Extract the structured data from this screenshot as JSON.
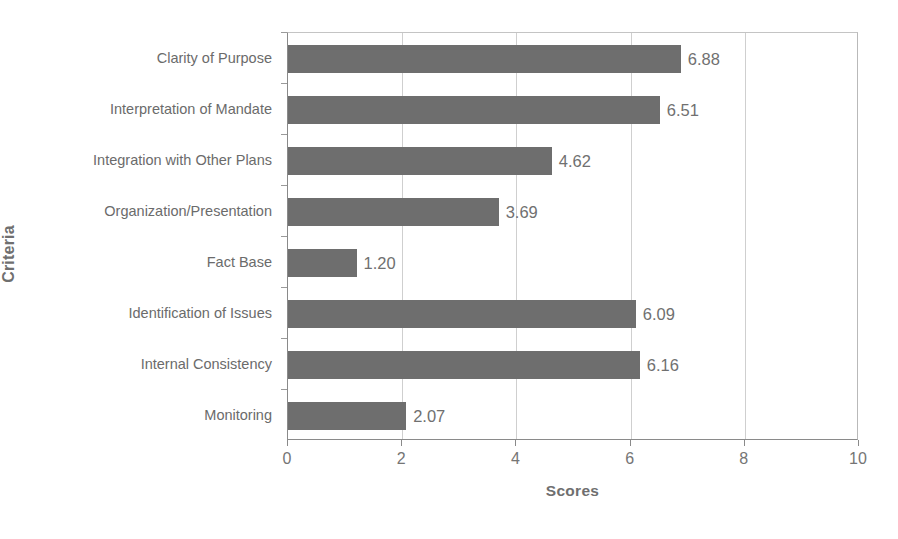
{
  "chart_data": {
    "type": "bar",
    "orientation": "horizontal",
    "title": "",
    "xlabel": "Scores",
    "ylabel": "Criteria",
    "categories": [
      "Clarity of Purpose",
      "Interpretation of Mandate",
      "Integration with Other Plans",
      "Organization/Presentation",
      "Fact Base",
      "Identification of Issues",
      "Internal Consistency",
      "Monitoring"
    ],
    "values": [
      6.88,
      6.51,
      4.62,
      3.69,
      1.2,
      6.09,
      6.16,
      2.07
    ],
    "value_labels": [
      "6.88",
      "6.51",
      "4.62",
      "3.69",
      "1.20",
      "6.09",
      "6.16",
      "2.07"
    ],
    "xlim": [
      0,
      10
    ],
    "xticks": [
      0,
      2,
      4,
      6,
      8,
      10
    ],
    "xtick_labels": [
      "0",
      "2",
      "4",
      "6",
      "8",
      "10"
    ],
    "grid": "vertical",
    "legend": "none",
    "bar_color": "#6e6e6e",
    "background_color": "#ffffff",
    "gridline_color": "#cfcfcf",
    "axis_color": "#8a8a8a",
    "text_color": "#6b6b6b"
  }
}
